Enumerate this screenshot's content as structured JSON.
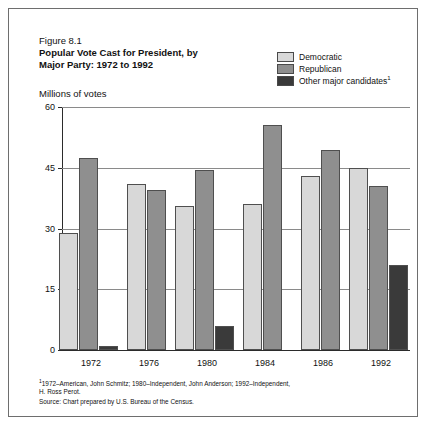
{
  "figure": {
    "number": "Figure 8.1",
    "title_line1": "Popular Vote Cast for President, by",
    "title_line2": "Major Party: 1972 to 1992",
    "unit_label": "Millions of votes"
  },
  "legend": {
    "items": [
      {
        "label": "Democratic",
        "color": "#d8d8d8"
      },
      {
        "label": "Republican",
        "color": "#8f8f8f"
      },
      {
        "label": "Other major candidates",
        "superscript": "1",
        "color": "#3a3a3a"
      }
    ]
  },
  "footnotes": {
    "line1": "1972–American, John Schmitz; 1980–Independent, John Anderson; 1992–Independent,",
    "line1_marker": "1",
    "line2": "H. Ross Perot.",
    "source": "Source: Chart prepared by U.S. Bureau of the Census."
  },
  "chart_data": {
    "type": "bar",
    "title": "Popular Vote Cast for President, by Major Party: 1972 to 1992",
    "xlabel": "",
    "ylabel": "Millions of votes",
    "ylim": [
      0,
      60
    ],
    "yticks": [
      0,
      15,
      30,
      45,
      60
    ],
    "ytick_labels": [
      "0",
      "15",
      "30",
      "45",
      "60"
    ],
    "grid": true,
    "legend_position": "top-right",
    "categories": [
      "1972",
      "1976",
      "1980",
      "1984",
      "1986",
      "1992"
    ],
    "series": [
      {
        "name": "Democratic",
        "color": "#d8d8d8",
        "values": [
          29.0,
          41.0,
          35.5,
          36.0,
          43.0,
          45.0
        ]
      },
      {
        "name": "Republican",
        "color": "#8f8f8f",
        "values": [
          47.5,
          39.5,
          44.5,
          55.5,
          49.5,
          40.5
        ]
      },
      {
        "name": "Other major candidates",
        "color": "#3a3a3a",
        "values": [
          1.1,
          0,
          6.0,
          0,
          0,
          21.0
        ]
      }
    ]
  }
}
